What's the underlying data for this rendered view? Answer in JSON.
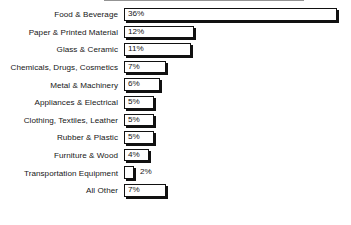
{
  "chart_data": {
    "type": "bar",
    "orientation": "horizontal",
    "title": "",
    "subtitle": "",
    "xlabel": "",
    "ylabel": "",
    "grid": false,
    "legend": false,
    "legend_position": "none",
    "xlim": [
      0,
      36
    ],
    "value_suffix": "%",
    "categories": [
      "Food & Beverage",
      "Paper & Printed Material",
      "Glass & Ceramic",
      "Chemicals, Drugs, Cosmetics",
      "Metal & Machinery",
      "Appliances & Electrical",
      "Clothing, Textiles, Leather",
      "Rubber & Plastic",
      "Furniture & Wood",
      "Transportation Equipment",
      "All Other"
    ],
    "values": [
      36,
      12,
      11,
      7,
      6,
      5,
      5,
      5,
      4,
      2,
      7
    ],
    "value_labels": [
      "36%",
      "12%",
      "11%",
      "7%",
      "6%",
      "5%",
      "5%",
      "5%",
      "4%",
      "2%",
      "7%"
    ],
    "label_placement": [
      "inside",
      "inside",
      "inside",
      "inside",
      "inside",
      "inside",
      "inside",
      "inside",
      "inside",
      "outside",
      "inside"
    ],
    "colors": {
      "background": "#ffffff",
      "bar_fill": "#ffffff",
      "bar_outline": "#111111",
      "bar_shadow": "#111111",
      "text": "#161616"
    },
    "rows": [
      {
        "label": "Food & Beverage",
        "value": 36,
        "value_label": "36%",
        "placement": "inside",
        "bar_px": 213
      },
      {
        "label": "Paper & Printed Material",
        "value": 12,
        "value_label": "12%",
        "placement": "inside",
        "bar_px": 70
      },
      {
        "label": "Glass & Ceramic",
        "value": 11,
        "value_label": "11%",
        "placement": "inside",
        "bar_px": 67
      },
      {
        "label": "Chemicals, Drugs, Cosmetics",
        "value": 7,
        "value_label": "7%",
        "placement": "inside",
        "bar_px": 42
      },
      {
        "label": "Metal & Machinery",
        "value": 6,
        "value_label": "6%",
        "placement": "inside",
        "bar_px": 36
      },
      {
        "label": "Appliances & Electrical",
        "value": 5,
        "value_label": "5%",
        "placement": "inside",
        "bar_px": 30
      },
      {
        "label": "Clothing, Textiles, Leather",
        "value": 5,
        "value_label": "5%",
        "placement": "inside",
        "bar_px": 30
      },
      {
        "label": "Rubber & Plastic",
        "value": 5,
        "value_label": "5%",
        "placement": "inside",
        "bar_px": 30
      },
      {
        "label": "Furniture & Wood",
        "value": 4,
        "value_label": "4%",
        "placement": "inside",
        "bar_px": 25
      },
      {
        "label": "Transportation Equipment",
        "value": 2,
        "value_label": "2%",
        "placement": "outside",
        "bar_px": 10
      },
      {
        "label": "All Other",
        "value": 7,
        "value_label": "7%",
        "placement": "inside",
        "bar_px": 42
      }
    ]
  }
}
